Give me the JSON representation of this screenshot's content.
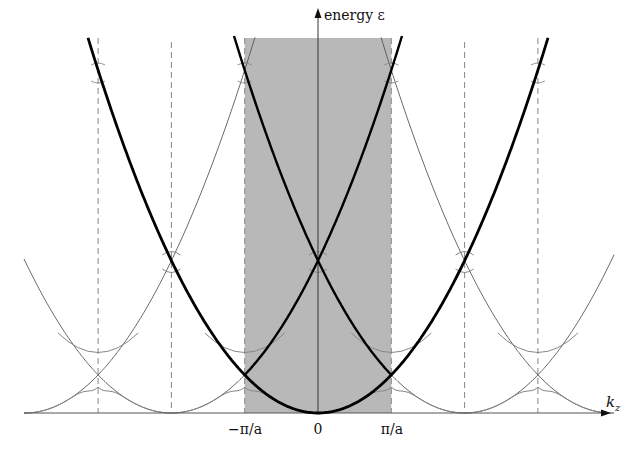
{
  "axes": {
    "y_label": "energy ε",
    "x_label": "k",
    "x_label_sub": "z",
    "ticks": [
      {
        "label": "−π/a",
        "k": -1
      },
      {
        "label": "0",
        "k": 0
      },
      {
        "label": "π/a",
        "k": 1
      }
    ]
  },
  "zone": {
    "label": "first Brillouin zone",
    "from_k": -1,
    "to_k": 1,
    "fill": "#b8b8b8"
  },
  "dashed_boundaries_k": [
    -3,
    -2,
    -1,
    1,
    2,
    3
  ],
  "colors": {
    "thick_curve": "#000000",
    "thin_curve": "#555555",
    "gap_curve": "#888888",
    "dashed": "#888888",
    "axis": "#555555"
  },
  "curves": {
    "free_parabola_centers_k": [
      -4,
      -2,
      0,
      2,
      4
    ],
    "thick_parabola_center_k": 0,
    "thick_inzone_parabola_centers_k": [
      -2,
      2
    ]
  }
}
